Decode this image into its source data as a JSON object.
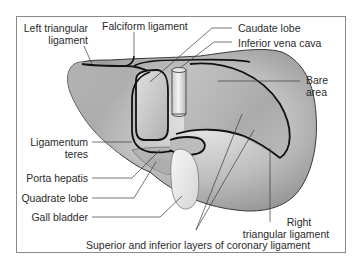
{
  "diagram": {
    "colors": {
      "frame_border": "#8a8a8a",
      "liver_fill_light": "#e4e4e4",
      "liver_fill_dark": "#9c9c9c",
      "outline": "#1a1a1a",
      "leader_line": "#3a3a3a",
      "label_text": "#2a2a2a",
      "gall_bladder_fill": "#eeeeee"
    },
    "labels": {
      "left_triangular_ligament": {
        "line1": "Left triangular",
        "line2": "ligament"
      },
      "falciform_ligament": "Falciform ligament",
      "caudate_lobe": "Caudate lobe",
      "inferior_vena_cava": "Inferior vena cava",
      "bare_area": {
        "line1": "Bare",
        "line2": "area"
      },
      "ligamentum_teres": {
        "line1": "Ligamentum",
        "line2": "teres"
      },
      "porta_hepatis": "Porta hepatis",
      "quadrate_lobe": "Quadrate lobe",
      "gall_bladder": "Gall bladder",
      "right_triangular_ligament": {
        "line1": "Right",
        "line2": "triangular ligament"
      },
      "coronary_ligament": "Superior and inferior layers of coronary ligament"
    }
  }
}
